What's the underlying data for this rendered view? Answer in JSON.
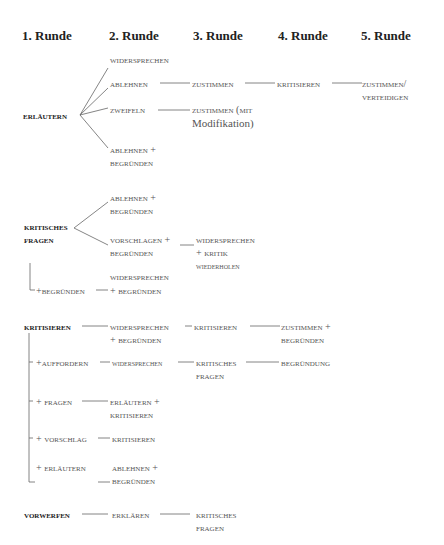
{
  "headers": [
    "1. Runde",
    "2. Runde",
    "3. Runde",
    "4. Runde",
    "5. Runde"
  ],
  "tree1": {
    "root": "Erläutern",
    "r2": [
      "Widersprechen",
      "Ablehnen",
      "Zweifeln",
      "Ablehnen +",
      "Begründen"
    ],
    "r3": [
      "Zustimmen",
      "Zustimmen (mit",
      "Modifikation)"
    ],
    "r4": [
      "Kritisieren"
    ],
    "r5": [
      "Zustimmen/",
      "Verteidigen"
    ]
  },
  "tree2": {
    "root_l1": "Kritisches",
    "root_l2": "Fragen",
    "r2": [
      "Ablehnen +",
      "Begründen",
      "Vorschlagen +",
      "Begründen",
      "Widersprechen",
      "+ Begründen"
    ],
    "branch": "+Begründen",
    "r3": [
      "Widersprechen",
      "+ Kritik",
      "wiederholen"
    ]
  },
  "tree3": {
    "root": "Kritisieren",
    "branches": [
      "+Auffordern",
      "+ Fragen",
      "+ Vorschlag",
      "+ Erläutern"
    ],
    "r2": [
      "Widersprechen",
      "+ Begründen",
      "widersprechen",
      "Erläutern +",
      "Kritisieren",
      "Kritisieren",
      "Ablehnen +",
      "Begründen"
    ],
    "r3": [
      "Kritisieren",
      "Kritisches",
      "Fragen"
    ],
    "r4": [
      "Zustimmen +",
      "Begründen",
      "Begründung"
    ]
  },
  "tree4": {
    "root": "Vorwerfen",
    "r2": [
      "Erklären"
    ],
    "r3": [
      "Kritisches",
      "Fragen"
    ]
  }
}
